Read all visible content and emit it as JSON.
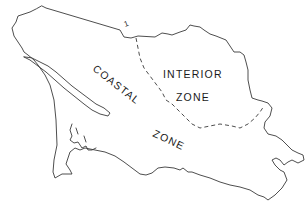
{
  "map": {
    "zones": [
      {
        "id": "interior",
        "label_line1": "INTERIOR",
        "label_line2": "ZONE"
      },
      {
        "id": "coastal",
        "label_line1": "COASTAL",
        "label_line2": "ZONE"
      }
    ],
    "marker": "1",
    "colors": {
      "line": "#3a3a3a",
      "text": "#1a1a1a",
      "background": "#ffffff"
    }
  }
}
